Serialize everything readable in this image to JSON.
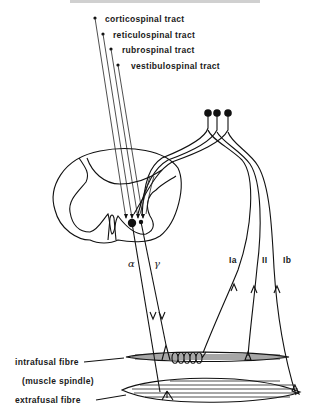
{
  "heading_fragment": "... PROCESSES OF THE SPINAL CORD",
  "descending_tracts": [
    {
      "label": "corticospinal  tract"
    },
    {
      "label": "reticulospinal  tract"
    },
    {
      "label": "rubrospinal  tract"
    },
    {
      "label": "vestibulospinal  tract"
    }
  ],
  "efferents": {
    "alpha": "α",
    "gamma": "γ"
  },
  "afferents": [
    {
      "label": "Ia"
    },
    {
      "label": "II"
    },
    {
      "label": "Ib"
    }
  ],
  "muscle_labels": {
    "intrafusal": "intrafusal  fibre",
    "spindle": "(muscle  spindle)",
    "extrafusal": "extrafusal  fibre"
  },
  "colors": {
    "ink": "#111111",
    "background": "#ffffff"
  }
}
